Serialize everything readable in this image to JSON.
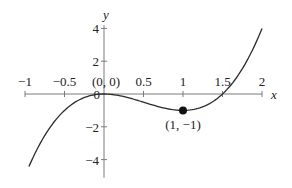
{
  "chart_data": {
    "type": "line",
    "title": "",
    "function": "f(x) = 2x^3 - 3x^2",
    "xlabel": "x",
    "ylabel": "y",
    "xlim": [
      -1,
      2
    ],
    "ylim": [
      -5,
      4.5
    ],
    "grid": false,
    "x_ticks": [
      -1,
      -0.5,
      0,
      0.5,
      1,
      1.5,
      2
    ],
    "x_tick_labels": [
      "−1",
      "−0.5",
      "0",
      "0.5",
      "1",
      "1.5",
      "2"
    ],
    "y_ticks": [
      4,
      2,
      0,
      -2,
      -4
    ],
    "y_tick_labels": [
      "4",
      "2",
      "0",
      "−2",
      "−4"
    ],
    "series": [
      {
        "name": "curve",
        "x_range": [
          -0.95,
          2.0
        ],
        "x": [
          -0.95,
          -0.75,
          -0.5,
          -0.25,
          0,
          0.25,
          0.5,
          0.75,
          1,
          1.25,
          1.5,
          1.75,
          2
        ],
        "y": [
          -4.42,
          -2.53,
          -1.0,
          -0.22,
          0,
          -0.16,
          -0.5,
          -0.84,
          -1,
          -0.78,
          0,
          1.53,
          4
        ]
      }
    ],
    "points": [
      {
        "x": 1,
        "y": -1,
        "label": "(1, −1)",
        "marker": "filled-circle"
      }
    ],
    "annotations": [
      {
        "x": 0,
        "y": 0,
        "label": "(0, 0)"
      }
    ]
  }
}
